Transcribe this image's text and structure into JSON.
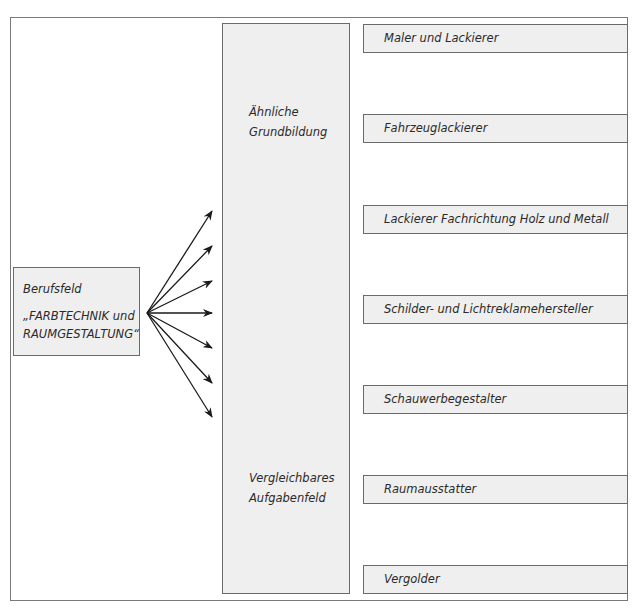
{
  "source": {
    "label": "Berufsfeld",
    "title_line1": "„FARBTECHNIK und",
    "title_line2": "RAUMGESTALTUNG“"
  },
  "middle": {
    "top_label_line1": "Ähnliche",
    "top_label_line2": "Grundbildung",
    "bottom_label_line1": "Vergleichbares",
    "bottom_label_line2": "Aufgabenfeld"
  },
  "professions": [
    {
      "label": "Maler und Lackierer"
    },
    {
      "label": "Fahrzeuglackierer"
    },
    {
      "label": "Lackierer Fachrichtung Holz und Metall"
    },
    {
      "label": "Schilder- und Lichtreklamehersteller"
    },
    {
      "label": "Schauwerbegestalter"
    },
    {
      "label": "Raumausstatter"
    },
    {
      "label": "Vergolder"
    }
  ],
  "arrows": {
    "count": 7,
    "origin": [
      147,
      313
    ],
    "tip_x": 212,
    "tip_ys": [
      211,
      246,
      281,
      313,
      348,
      383,
      417
    ]
  },
  "colors": {
    "box_fill": "#efefef",
    "box_border": "#6a6a6a",
    "frame_border": "#7a7a7a",
    "text": "#2a2a2a",
    "arrow": "#1a1a1a"
  }
}
